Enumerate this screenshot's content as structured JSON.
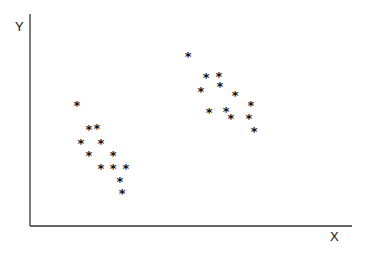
{
  "chart_data": {
    "type": "scatter",
    "title": "",
    "xlabel": "X",
    "ylabel": "Y",
    "marker": "*",
    "grid": false,
    "legend": null,
    "axis_ticks": false,
    "xlim": [
      0,
      100
    ],
    "ylim": [
      0,
      100
    ],
    "series": [
      {
        "name": "cluster-1",
        "points": [
          {
            "x": 14.6,
            "y": 58.5
          },
          {
            "x": 18.3,
            "y": 47.2
          },
          {
            "x": 20.8,
            "y": 47.6
          },
          {
            "x": 15.8,
            "y": 40.6
          },
          {
            "x": 22.0,
            "y": 40.6
          },
          {
            "x": 18.3,
            "y": 34.9
          },
          {
            "x": 25.8,
            "y": 34.9
          },
          {
            "x": 22.0,
            "y": 28.8
          },
          {
            "x": 25.8,
            "y": 28.8
          },
          {
            "x": 29.8,
            "y": 28.8
          },
          {
            "x": 27.9,
            "y": 22.6
          },
          {
            "x": 28.6,
            "y": 17.0
          }
        ]
      },
      {
        "name": "cluster-2",
        "points": [
          {
            "x": 49.1,
            "y": 81.6
          },
          {
            "x": 54.7,
            "y": 71.7
          },
          {
            "x": 58.7,
            "y": 72.2
          },
          {
            "x": 59.0,
            "y": 67.5
          },
          {
            "x": 53.1,
            "y": 65.1
          },
          {
            "x": 63.7,
            "y": 63.2
          },
          {
            "x": 68.6,
            "y": 58.5
          },
          {
            "x": 55.6,
            "y": 55.2
          },
          {
            "x": 60.9,
            "y": 55.7
          },
          {
            "x": 62.4,
            "y": 52.4
          },
          {
            "x": 68.0,
            "y": 52.4
          },
          {
            "x": 69.6,
            "y": 46.2
          }
        ]
      }
    ]
  },
  "labels": {
    "x_axis": "X",
    "y_axis": "Y",
    "marker_glyph": "*"
  }
}
